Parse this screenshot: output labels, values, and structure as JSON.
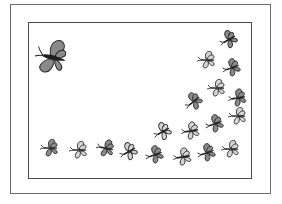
{
  "illustration": {
    "subject": "butterflies",
    "colors": {
      "dark_wing": "#8a8a8a",
      "light_wing": "#d4d4d4",
      "body": "#1e1e1e",
      "outline": "#2a2a2a",
      "frame": "#5a5a5a"
    },
    "large_butterfly": {
      "x": 52,
      "y": 57,
      "scale": 1.0,
      "rotation": 10,
      "shade": "dark"
    },
    "small_butterflies": [
      {
        "x": 228,
        "y": 40,
        "rot": -30,
        "shade": "dark"
      },
      {
        "x": 206,
        "y": 60,
        "rot": 0,
        "shade": "light"
      },
      {
        "x": 231,
        "y": 68,
        "rot": -20,
        "shade": "dark"
      },
      {
        "x": 216,
        "y": 88,
        "rot": 0,
        "shade": "light"
      },
      {
        "x": 193,
        "y": 102,
        "rot": -40,
        "shade": "dark"
      },
      {
        "x": 237,
        "y": 98,
        "rot": -10,
        "shade": "dark"
      },
      {
        "x": 237,
        "y": 116,
        "rot": 0,
        "shade": "light"
      },
      {
        "x": 214,
        "y": 124,
        "rot": -20,
        "shade": "dark"
      },
      {
        "x": 190,
        "y": 131,
        "rot": -10,
        "shade": "light"
      },
      {
        "x": 162,
        "y": 132,
        "rot": -30,
        "shade": "light"
      },
      {
        "x": 230,
        "y": 149,
        "rot": 0,
        "shade": "light"
      },
      {
        "x": 206,
        "y": 153,
        "rot": -20,
        "shade": "dark"
      },
      {
        "x": 182,
        "y": 157,
        "rot": -10,
        "shade": "light"
      },
      {
        "x": 154,
        "y": 155,
        "rot": -20,
        "shade": "dark"
      },
      {
        "x": 128,
        "y": 152,
        "rot": -30,
        "shade": "light"
      },
      {
        "x": 105,
        "y": 148,
        "rot": 10,
        "shade": "dark"
      },
      {
        "x": 78,
        "y": 150,
        "rot": 0,
        "shade": "light"
      },
      {
        "x": 49,
        "y": 148,
        "rot": 0,
        "shade": "dark"
      }
    ]
  }
}
